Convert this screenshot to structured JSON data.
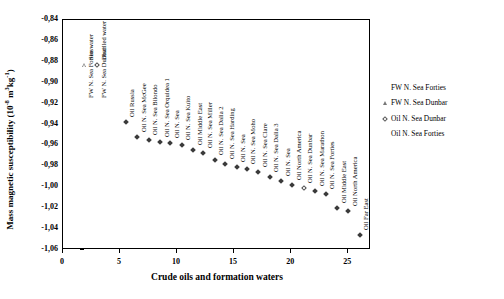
{
  "chart_data": {
    "type": "scatter",
    "title": "",
    "xlabel": "Crude oils and formation waters",
    "ylabel": "Mass magnetic susceptibility (10-8 m3kg-1)",
    "ylabel_prefix": "Mass magnetic susceptibility (10",
    "ylabel_exp1": "-8",
    "ylabel_mid": " m",
    "ylabel_exp2": "3",
    "ylabel_unit": "kg",
    "ylabel_exp3": "-1",
    "ylabel_suffix": ")",
    "xlim": [
      0,
      27
    ],
    "ylim": [
      -1.06,
      -0.84
    ],
    "grid": false,
    "yticks": [
      "-0,84",
      "-0,86",
      "-0,88",
      "-0,90",
      "-0,92",
      "-0,94",
      "-0,96",
      "-0,98",
      "-1,00",
      "-1,02",
      "-1,04",
      "-1,06"
    ],
    "ytick_values": [
      -0.84,
      -0.86,
      -0.88,
      -0.9,
      -0.92,
      -0.94,
      -0.96,
      -0.98,
      -1.0,
      -1.02,
      -1.04,
      -1.06
    ],
    "xticks": [
      "0",
      "5",
      "10",
      "15",
      "20",
      "25"
    ],
    "xtick_values": [
      0,
      5,
      10,
      15,
      20,
      25
    ],
    "points": [
      {
        "x": 2.0,
        "y": -0.884,
        "label": "Sea water",
        "marker": "triangle-open"
      },
      {
        "x": 3.1,
        "y": -0.884,
        "label": "Distilled water",
        "marker": "diamond-open"
      },
      {
        "x": 5.6,
        "y": -0.9385,
        "label": "Oil Russia",
        "marker": "diamond-filled"
      },
      {
        "x": 6.6,
        "y": -0.9525,
        "label": "Oil N. Sea McGee",
        "marker": "diamond-filled"
      },
      {
        "x": 7.6,
        "y": -0.9555,
        "label": "Oil N. Sea Bilondo",
        "marker": "diamond-filled"
      },
      {
        "x": 8.6,
        "y": -0.9575,
        "label": "Oil N. Sea Orquidea 1",
        "marker": "diamond-filled"
      },
      {
        "x": 9.5,
        "y": -0.9585,
        "label": "Oil N. Sea",
        "marker": "diamond-filled"
      },
      {
        "x": 10.5,
        "y": -0.9605,
        "label": "Oil N. Sea Kuito",
        "marker": "diamond-filled"
      },
      {
        "x": 11.5,
        "y": -0.9655,
        "label": "Oil Middle East",
        "marker": "diamond-filled"
      },
      {
        "x": 12.4,
        "y": -0.9685,
        "label": "Oil N. Sea Miller",
        "marker": "diamond-filled"
      },
      {
        "x": 13.4,
        "y": -0.9745,
        "label": "Oil N. Sea Dalia 2",
        "marker": "diamond-filled"
      },
      {
        "x": 14.3,
        "y": -0.9785,
        "label": "Oil N. Sea Harding",
        "marker": "diamond-filled"
      },
      {
        "x": 15.3,
        "y": -0.9815,
        "label": "Oil N. Sea",
        "marker": "diamond-filled"
      },
      {
        "x": 16.2,
        "y": -0.9835,
        "label": "Oil N. Sea Moho",
        "marker": "diamond-filled"
      },
      {
        "x": 17.2,
        "y": -0.9865,
        "label": "Oil N. Sea Clare",
        "marker": "diamond-filled"
      },
      {
        "x": 18.2,
        "y": -0.9915,
        "label": "Oil N. Sea Dalia 3",
        "marker": "diamond-filled"
      },
      {
        "x": 19.2,
        "y": -0.9945,
        "label": "Oil N. Sea",
        "marker": "diamond-filled"
      },
      {
        "x": 20.2,
        "y": -0.9985,
        "label": "Oil North America",
        "marker": "diamond-filled"
      },
      {
        "x": 21.2,
        "y": -1.0015,
        "label": "Oil N. Sea Dunbar",
        "marker": "diamond-open"
      },
      {
        "x": 22.2,
        "y": -1.0045,
        "label": "Oil N. Sea Marathon",
        "marker": "diamond-filled"
      },
      {
        "x": 23.1,
        "y": -1.0075,
        "label": "Oil N. Sea Forties",
        "marker": "diamond-filled"
      },
      {
        "x": 24.1,
        "y": -1.0205,
        "label": "Oil Middle East",
        "marker": "diamond-filled"
      },
      {
        "x": 25.1,
        "y": -1.0235,
        "label": "Oil North America",
        "marker": "diamond-filled"
      },
      {
        "x": 26.1,
        "y": -1.0465,
        "label": "Oil Far East",
        "marker": "diamond-filled"
      }
    ],
    "inline_labels": [
      {
        "x": 2.0,
        "y": -0.92,
        "label": "FW N. Sea Forties",
        "marker": "none"
      },
      {
        "x": 3.1,
        "y": -0.92,
        "label": "FW N. Sea Dunbar",
        "marker": "none"
      }
    ],
    "legend_position": "right",
    "legend": [
      {
        "label": "FW N. Sea Forties",
        "marker": "blank"
      },
      {
        "label": "FW N. Sea Dunbar",
        "marker": "triangle-open"
      },
      {
        "label": "Oil N. Sea Dunbar",
        "marker": "diamond-open"
      },
      {
        "label": "Oil N. Sea Forties",
        "marker": "blank"
      }
    ]
  }
}
